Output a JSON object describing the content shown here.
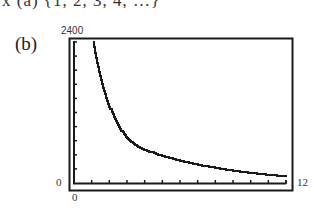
{
  "header": {
    "top_text": "x (a)  {1, 2, 3, 4, …}",
    "part_label": "(b)"
  },
  "chart_data": {
    "type": "line",
    "title": "",
    "xlabel": "",
    "ylabel": "",
    "xlim": [
      0,
      12
    ],
    "ylim": [
      0,
      2400
    ],
    "x_tick_labels": [
      "0",
      "12"
    ],
    "y_tick_labels": [
      "0",
      "2400"
    ],
    "x_ticks_count": 12,
    "y_ticks_count": 10,
    "grid": false,
    "legend": null,
    "series": [
      {
        "name": "curve",
        "x": [
          1.1,
          1.5,
          2,
          2.5,
          3,
          3.5,
          4,
          5,
          6,
          7,
          8,
          9,
          10,
          11,
          12
        ],
        "y": [
          2400,
          1750,
          1300,
          980,
          760,
          640,
          560,
          460,
          380,
          310,
          260,
          210,
          170,
          140,
          110
        ]
      }
    ]
  },
  "colors": {
    "frame": "#1a1a1a",
    "curve": "#1a1a1a",
    "background": "#ffffff"
  }
}
